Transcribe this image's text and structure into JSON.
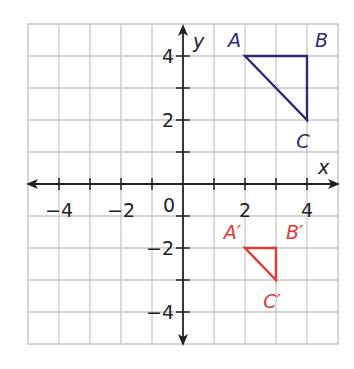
{
  "axes": {
    "x_label": "x",
    "y_label": "y",
    "origin_label": "0"
  },
  "x_ticks": [
    {
      "v": -4,
      "t": "−4"
    },
    {
      "v": -2,
      "t": "−2"
    },
    {
      "v": 2,
      "t": "2"
    },
    {
      "v": 4,
      "t": "4"
    }
  ],
  "y_ticks": [
    {
      "v": 4,
      "t": "4"
    },
    {
      "v": 2,
      "t": "2"
    },
    {
      "v": -2,
      "t": "−2"
    },
    {
      "v": -4,
      "t": "−4"
    }
  ],
  "colors": {
    "original": "#2e2a7a",
    "image": "#e03a35",
    "grid": "#c8c8c8",
    "axis": "#222222"
  },
  "triangles": [
    {
      "name": "ABC",
      "color": "#2e2a7a",
      "vertices": [
        {
          "label": "A",
          "x": 2,
          "y": 4
        },
        {
          "label": "B",
          "x": 4,
          "y": 4
        },
        {
          "label": "C",
          "x": 4,
          "y": 2
        }
      ]
    },
    {
      "name": "A'B'C'",
      "color": "#e03a35",
      "vertices": [
        {
          "label": "A′",
          "x": 2,
          "y": -2
        },
        {
          "label": "B′",
          "x": 3,
          "y": -2
        },
        {
          "label": "C′",
          "x": 3,
          "y": -3
        }
      ]
    }
  ]
}
